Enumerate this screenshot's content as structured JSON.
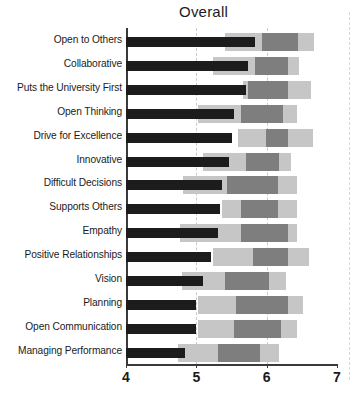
{
  "chart": {
    "title": "Overall",
    "xlabel": "",
    "ylabel": ""
  },
  "axis": {
    "ticks": [
      "4",
      "5",
      "6",
      "7"
    ],
    "tick_values": [
      4,
      5,
      6,
      7
    ],
    "min": 4,
    "max": 7
  },
  "colors": {
    "mean_bar": "#1c1c1c",
    "outer_range": "#c6c6c6",
    "inner_range": "#7e7e7e",
    "axis": "#3a3a3a",
    "gridline": "#c9c9c9",
    "background": "#ffffff"
  },
  "chart_data": {
    "type": "bar",
    "title": "Overall",
    "xlabel": "",
    "ylabel": "",
    "xlim": [
      4,
      7
    ],
    "grid": true,
    "legend": "none",
    "orientation": "horizontal",
    "categories": [
      "Open to Others",
      "Collaborative",
      "Puts the University First",
      "Open Thinking",
      "Drive for Excellence",
      "Innovative",
      "Difficult Decisions",
      "Supports Others",
      "Empathy",
      "Positive Relationships",
      "Vision",
      "Planning",
      "Open Communication",
      "Managing Performance"
    ],
    "series": [
      {
        "name": "Mean",
        "values": [
          5.84,
          5.74,
          5.7,
          5.54,
          5.51,
          5.46,
          5.37,
          5.34,
          5.31,
          5.21,
          5.09,
          5.0,
          5.0,
          4.84
        ]
      },
      {
        "name": "Outer range start",
        "values": [
          5.41,
          5.23,
          5.66,
          5.03,
          5.59,
          5.1,
          4.81,
          5.37,
          4.77,
          5.23,
          4.8,
          5.03,
          5.03,
          4.74
        ]
      },
      {
        "name": "Inner range start",
        "values": [
          5.94,
          5.83,
          5.73,
          5.63,
          5.99,
          5.7,
          5.43,
          5.63,
          5.63,
          5.81,
          5.41,
          5.56,
          5.54,
          5.31
        ]
      },
      {
        "name": "Inner range end",
        "values": [
          6.44,
          6.31,
          6.31,
          6.23,
          6.3,
          6.17,
          6.16,
          6.16,
          6.3,
          6.3,
          6.03,
          6.31,
          6.21,
          5.91
        ]
      },
      {
        "name": "Outer range end",
        "values": [
          6.67,
          6.46,
          6.63,
          6.43,
          6.66,
          6.34,
          6.43,
          6.43,
          6.43,
          6.6,
          6.27,
          6.51,
          6.43,
          6.17
        ]
      }
    ]
  }
}
